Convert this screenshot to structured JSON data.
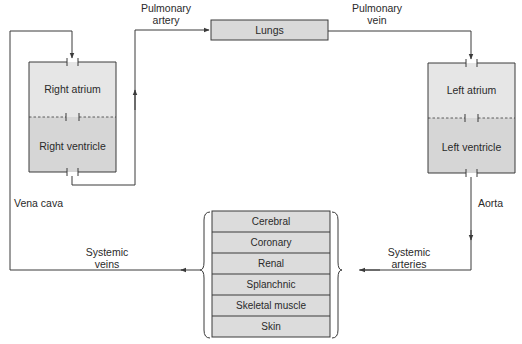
{
  "diagram": {
    "type": "circulatory-system-flow",
    "colors": {
      "line": "#3a3a3a",
      "atrium_fill": "#e6e6e6",
      "ventricle_fill": "#d6d6d6",
      "lungs_fill": "#d9d9d9",
      "organ_fill": "#dcdcdc",
      "text": "#2a2a2a"
    },
    "heart_right": {
      "upper": "Right atrium",
      "lower": "Right ventricle"
    },
    "heart_left": {
      "upper": "Left atrium",
      "lower": "Left ventricle"
    },
    "lungs": "Lungs",
    "vessels": {
      "pulmonary_artery_1": "Pulmonary",
      "pulmonary_artery_2": "artery",
      "pulmonary_vein_1": "Pulmonary",
      "pulmonary_vein_2": "vein",
      "vena_cava": "Vena cava",
      "aorta": "Aorta",
      "systemic_veins_1": "Systemic",
      "systemic_veins_2": "veins",
      "systemic_arteries_1": "Systemic",
      "systemic_arteries_2": "arteries"
    },
    "organs": [
      "Cerebral",
      "Coronary",
      "Renal",
      "Splanchnic",
      "Skeletal muscle",
      "Skin"
    ]
  }
}
